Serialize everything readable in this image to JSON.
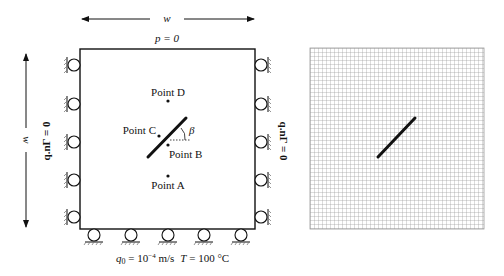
{
  "left_diagram": {
    "width_label": "w",
    "height_label": "w",
    "top_boundary": "p = 0",
    "left_boundary": "q.nΓ = 0",
    "right_boundary": "q.nΓ = 0",
    "bottom_boundary": {
      "flux": "q0 = 10⁻⁴ m/s",
      "q_symbol": "q",
      "q_sub": "0",
      "q_eq": " = 10",
      "q_exp": "−4",
      "q_unit": " m/s",
      "temp_symbol": "T",
      "temp_value": " = 100 °C"
    },
    "points": [
      {
        "label": "Point D",
        "x": 168,
        "y": 101
      },
      {
        "label": "Point C",
        "x": 159,
        "y": 136
      },
      {
        "label": "Point B",
        "x": 168,
        "y": 145
      },
      {
        "label": "Point A",
        "x": 168,
        "y": 176
      }
    ],
    "angle_label": "β",
    "crack": {
      "x1": 148,
      "y1": 157,
      "x2": 186,
      "y2": 118
    }
  },
  "right_diagram": {
    "mesh": {
      "x": 310,
      "y": 48,
      "width": 174,
      "height": 181,
      "cell": 4
    },
    "crack": {
      "x1": 378,
      "y1": 157,
      "x2": 415,
      "y2": 118
    }
  },
  "colors": {
    "line": "#111111",
    "grid": "#9a9a9a",
    "hatch": "#777777"
  }
}
